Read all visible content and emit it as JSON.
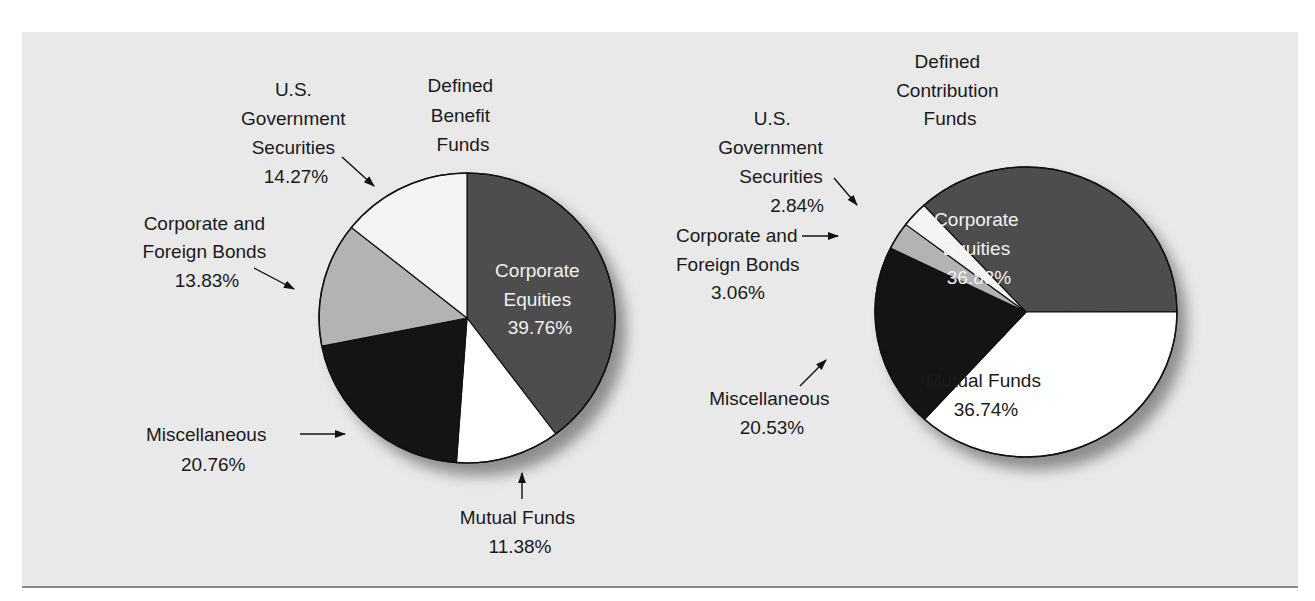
{
  "chart_data": [
    {
      "type": "pie",
      "title": "Defined Benefit Funds",
      "start_angle_deg": 0,
      "direction": "clockwise",
      "slices": [
        {
          "label": "Corporate Equities",
          "value": 39.76,
          "display": "39.76%",
          "color": "#4d4d4d"
        },
        {
          "label": "Mutual Funds",
          "value": 11.38,
          "display": "11.38%",
          "color": "#ffffff"
        },
        {
          "label": "Miscellaneous",
          "value": 20.76,
          "display": "20.76%",
          "color": "#141414"
        },
        {
          "label": "Corporate and Foreign Bonds",
          "value": 13.83,
          "display": "13.83%",
          "color": "#b3b3b3"
        },
        {
          "label": "U.S. Government Securities",
          "value": 14.27,
          "display": "14.27%",
          "color": "#f4f4f4"
        }
      ]
    },
    {
      "type": "pie",
      "title": "Defined Contribution Funds",
      "start_angle_deg": -42.6,
      "direction": "clockwise",
      "slices": [
        {
          "label": "Corporate Equities",
          "value": 36.83,
          "display": "36.83%",
          "color": "#4d4d4d"
        },
        {
          "label": "Mutual Funds",
          "value": 36.74,
          "display": "36.74%",
          "color": "#ffffff"
        },
        {
          "label": "Miscellaneous",
          "value": 20.53,
          "display": "20.53%",
          "color": "#141414"
        },
        {
          "label": "Corporate and Foreign Bonds",
          "value": 3.06,
          "display": "3.06%",
          "color": "#b3b3b3"
        },
        {
          "label": "U.S. Government Securities",
          "value": 2.84,
          "display": "2.84%",
          "color": "#f4f4f4"
        }
      ]
    }
  ],
  "left_chart": {
    "title": [
      "Defined",
      "Benefit",
      "Funds"
    ],
    "labels": {
      "gov": [
        "U.S.",
        "Government",
        "Securities",
        "14.27%"
      ],
      "bonds": [
        "Corporate and",
        "Foreign Bonds",
        "13.83%"
      ],
      "equities": [
        "Corporate",
        "Equities",
        "39.76%"
      ],
      "misc": [
        "Miscellaneous",
        "20.76%"
      ],
      "mutual": [
        "Mutual Funds",
        "11.38%"
      ]
    }
  },
  "right_chart": {
    "title": [
      "Defined",
      "Contribution",
      "Funds"
    ],
    "labels": {
      "gov": [
        "U.S.",
        "Government",
        "Securities",
        "2.84%"
      ],
      "bonds": [
        "Corporate and",
        "Foreign Bonds",
        "3.06%"
      ],
      "equities": [
        "Corporate",
        "Equities",
        "36.83%"
      ],
      "misc": [
        "Miscellaneous",
        "20.53%"
      ],
      "mutual": [
        "Mutual Funds",
        "36.74%"
      ]
    }
  }
}
